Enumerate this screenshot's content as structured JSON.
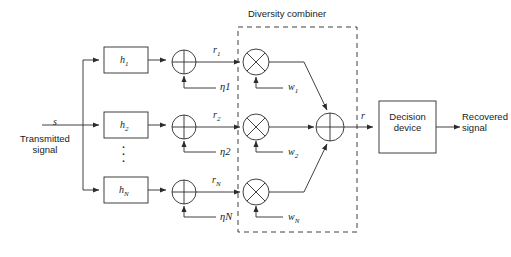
{
  "figure": {
    "stroke_color": "#2b2b2b",
    "text_color": "#1a1a1a",
    "background": "#ffffff"
  },
  "input": {
    "signal_symbol": "s",
    "caption_line1": "Transmitted",
    "caption_line2": "signal",
    "vertical_dots": "⋮"
  },
  "branches": [
    {
      "channel_label": "h",
      "channel_sub": "1",
      "received_label": "r",
      "received_sub": "1",
      "noise_label": "η",
      "noise_sub": "1",
      "weight_label": "w",
      "weight_sub": "1"
    },
    {
      "channel_label": "h",
      "channel_sub": "2",
      "received_label": "r",
      "received_sub": "2",
      "noise_label": "η",
      "noise_sub": "2",
      "weight_label": "w",
      "weight_sub": "2"
    },
    {
      "channel_label": "h",
      "channel_sub": "N",
      "received_label": "r",
      "received_sub": "N",
      "noise_label": "η",
      "noise_sub": "N",
      "weight_label": "w",
      "weight_sub": "N"
    }
  ],
  "combiner": {
    "title": "Diversity combiner",
    "output_symbol": "r"
  },
  "decision": {
    "line1": "Decision",
    "line2": "device"
  },
  "output": {
    "caption_line1": "Recovered",
    "caption_line2": "signal"
  },
  "icons": {
    "summing_junction": "circle-plus-icon",
    "multiplier": "circle-cross-icon",
    "arrow": "arrowhead-icon"
  }
}
